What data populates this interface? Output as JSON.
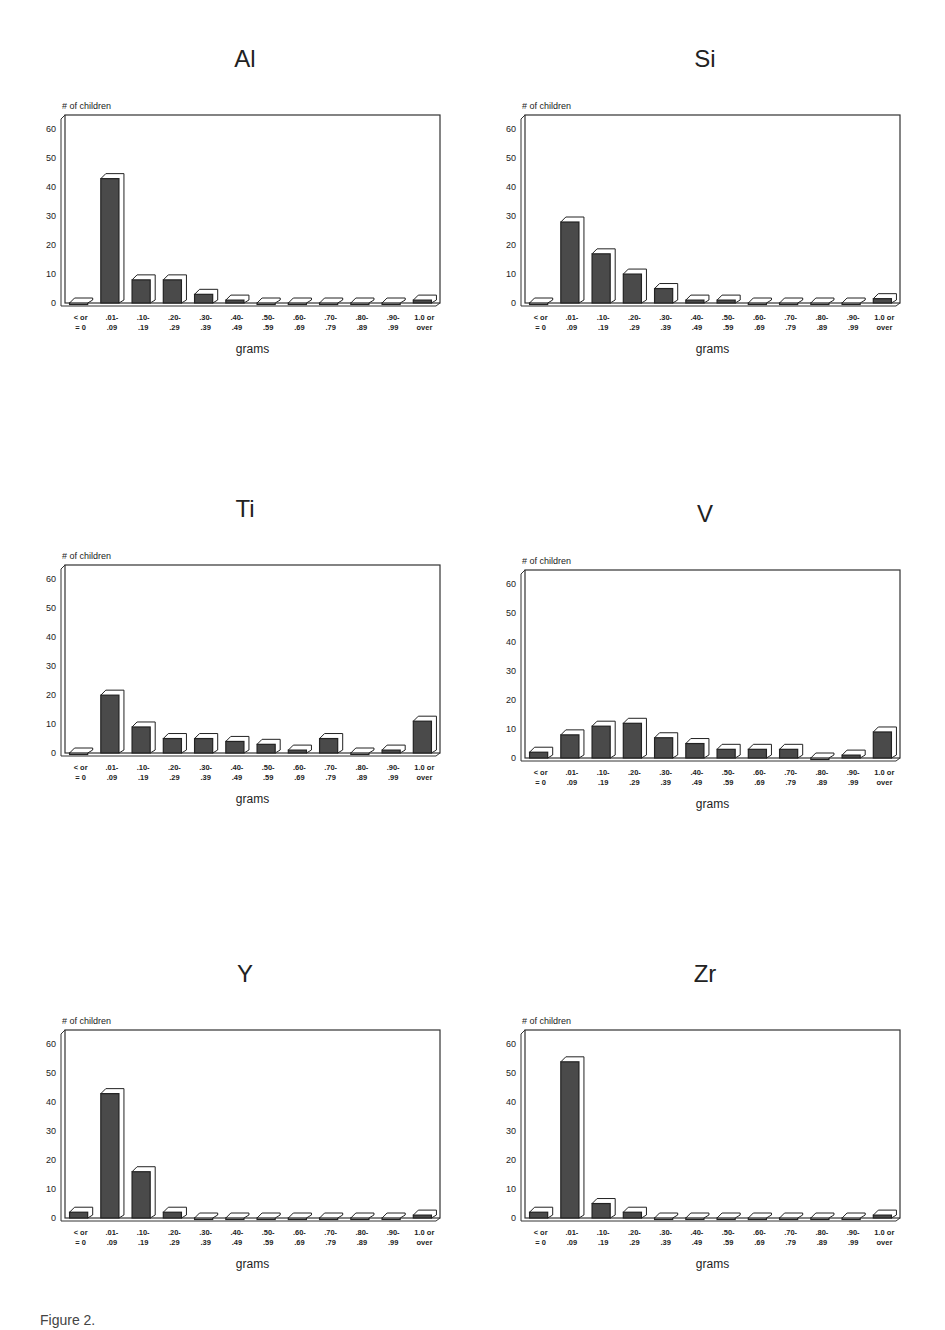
{
  "figure": {
    "caption": "Figure 2."
  },
  "chart_data": [
    {
      "type": "bar",
      "title": "Al",
      "ylabel": "# of children",
      "xlabel": "grams",
      "ylim": [
        0,
        65
      ],
      "yticks": [
        0,
        10,
        20,
        30,
        40,
        50,
        60
      ],
      "categories": [
        "< or = 0",
        ".01-.09",
        ".10-.19",
        ".20-.29",
        ".30-.39",
        ".40-.49",
        ".50-.59",
        ".60-.69",
        ".70-.79",
        ".80-.89",
        ".90-.99",
        "1.0 or over"
      ],
      "values": [
        0,
        43,
        8,
        8,
        3,
        1,
        0,
        0,
        0,
        0,
        0,
        1
      ]
    },
    {
      "type": "bar",
      "title": "Si",
      "ylabel": "# of children",
      "xlabel": "grams",
      "ylim": [
        0,
        65
      ],
      "yticks": [
        0,
        10,
        20,
        30,
        40,
        50,
        60
      ],
      "categories": [
        "< or = 0",
        ".01-.09",
        ".10-.19",
        ".20-.29",
        ".30-.39",
        ".40-.49",
        ".50-.59",
        ".60-.69",
        ".70-.79",
        ".80-.89",
        ".90-.99",
        "1.0 or over"
      ],
      "values": [
        0,
        28,
        17,
        10,
        5,
        1,
        1,
        0,
        0,
        0,
        0,
        1.5
      ]
    },
    {
      "type": "bar",
      "title": "Ti",
      "ylabel": "# of children",
      "xlabel": "grams",
      "ylim": [
        0,
        65
      ],
      "yticks": [
        0,
        10,
        20,
        30,
        40,
        50,
        60
      ],
      "categories": [
        "< or = 0",
        ".01-.09",
        ".10-.19",
        ".20-.29",
        ".30-.39",
        ".40-.49",
        ".50-.59",
        ".60-.69",
        ".70-.79",
        ".80-.89",
        ".90-.99",
        "1.0 or over"
      ],
      "values": [
        0,
        20,
        9,
        5,
        5,
        4,
        3,
        1,
        5,
        0,
        1,
        11
      ]
    },
    {
      "type": "bar",
      "title": "V",
      "ylabel": "# of children",
      "xlabel": "grams",
      "ylim": [
        0,
        65
      ],
      "yticks": [
        0,
        10,
        20,
        30,
        40,
        50,
        60
      ],
      "categories": [
        "< or = 0",
        ".01-.09",
        ".10-.19",
        ".20-.29",
        ".30-.39",
        ".40-.49",
        ".50-.59",
        ".60-.69",
        ".70-.79",
        ".80-.89",
        ".90-.99",
        "1.0 or over"
      ],
      "values": [
        2,
        8,
        11,
        12,
        7,
        5,
        3,
        3,
        3,
        0,
        1,
        9
      ]
    },
    {
      "type": "bar",
      "title": "Y",
      "ylabel": "# of children",
      "xlabel": "grams",
      "ylim": [
        0,
        65
      ],
      "yticks": [
        0,
        10,
        20,
        30,
        40,
        50,
        60
      ],
      "categories": [
        "< or = 0",
        ".01-.09",
        ".10-.19",
        ".20-.29",
        ".30-.39",
        ".40-.49",
        ".50-.59",
        ".60-.69",
        ".70-.79",
        ".80-.89",
        ".90-.99",
        "1.0 or over"
      ],
      "values": [
        2,
        43,
        16,
        2,
        0,
        0,
        0,
        0,
        0,
        0,
        0,
        1
      ]
    },
    {
      "type": "bar",
      "title": "Zr",
      "ylabel": "# of children",
      "xlabel": "grams",
      "ylim": [
        0,
        65
      ],
      "yticks": [
        0,
        10,
        20,
        30,
        40,
        50,
        60
      ],
      "categories": [
        "< or = 0",
        ".01-.09",
        ".10-.19",
        ".20-.29",
        ".30-.39",
        ".40-.49",
        ".50-.59",
        ".60-.69",
        ".70-.79",
        ".80-.89",
        ".90-.99",
        "1.0 or over"
      ],
      "values": [
        2,
        54,
        5,
        2,
        0,
        0,
        0,
        0,
        0,
        0,
        0,
        1
      ]
    }
  ],
  "tick_label_lines": [
    [
      "< or",
      "= 0"
    ],
    [
      ".01-",
      ".09"
    ],
    [
      ".10-",
      ".19"
    ],
    [
      ".20-",
      ".29"
    ],
    [
      ".30-",
      ".39"
    ],
    [
      ".40-",
      ".49"
    ],
    [
      ".50-",
      ".59"
    ],
    [
      ".60-",
      ".69"
    ],
    [
      ".70-",
      ".79"
    ],
    [
      ".80-",
      ".89"
    ],
    [
      ".90-",
      ".99"
    ],
    [
      "1.0 or",
      "over"
    ]
  ],
  "colors": {
    "bar_fill": "#4a4a4a",
    "bar_outline": "#222222",
    "frame": "#333333",
    "text": "#222222"
  }
}
